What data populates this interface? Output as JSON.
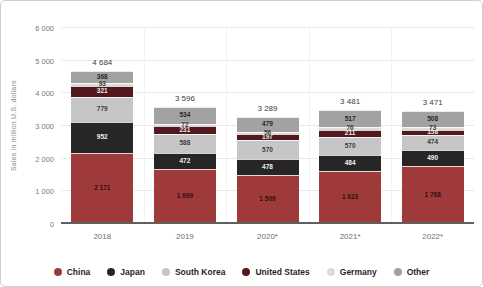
{
  "chart_data": {
    "type": "bar",
    "stacked": true,
    "ylabel": "Sales in million U.S. dollars",
    "categories": [
      "2018",
      "2019",
      "2020*",
      "2021*",
      "2022*"
    ],
    "totals": [
      4684,
      3596,
      3289,
      3481,
      3471
    ],
    "series": [
      {
        "name": "China",
        "color": "#9e3a3a",
        "label_color": "#33100f",
        "values": [
          2171,
          1699,
          1509,
          1623,
          1768
        ]
      },
      {
        "name": "Japan",
        "color": "#262626",
        "label_color": "#f2f2f2",
        "values": [
          952,
          472,
          478,
          484,
          490
        ]
      },
      {
        "name": "South Korea",
        "color": "#c6c6c6",
        "label_color": "#3c3c3c",
        "values": [
          779,
          588,
          570,
          570,
          474
        ]
      },
      {
        "name": "United States",
        "color": "#54191f",
        "label_color": "#eaeaea",
        "values": [
          321,
          231,
          197,
          211,
          158
        ]
      },
      {
        "name": "Germany",
        "color": "#dcdcdc",
        "label_color": "#3c3c3c",
        "values": [
          93,
          72,
          56,
          76,
          73
        ]
      },
      {
        "name": "Other",
        "color": "#a2a2a2",
        "label_color": "#262626",
        "values": [
          368,
          534,
          479,
          517,
          508
        ]
      }
    ],
    "ylim": [
      0,
      6000
    ],
    "y_ticks": [
      0,
      1000,
      2000,
      3000,
      4000,
      5000,
      6000
    ],
    "grid": true,
    "legend_position": "bottom"
  }
}
